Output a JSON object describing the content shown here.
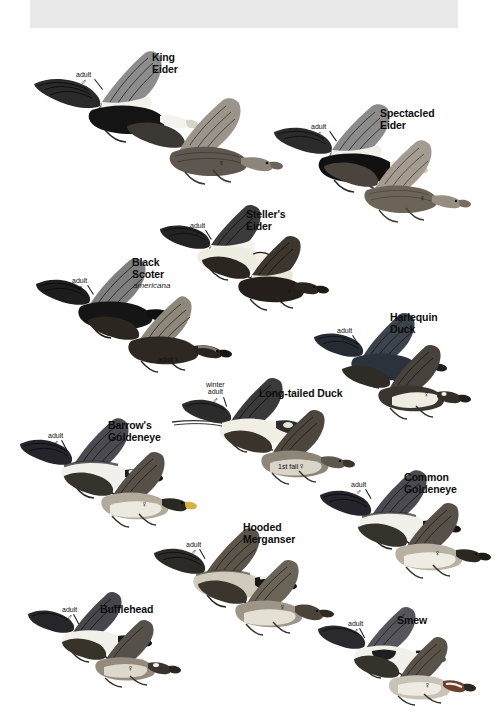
{
  "page": {
    "kind": "field-guide-plate",
    "background_color": "#ffffff",
    "banner_color": "#e8e8e8",
    "width": 484,
    "height": 725
  },
  "species": [
    {
      "id": "king-eider",
      "name": "King\nEider",
      "subspecies": "",
      "name_pos": {
        "x": 152,
        "y": 52
      },
      "callouts": [
        {
          "text": "adult",
          "symbol": "♂",
          "x": 76,
          "y": 63
        },
        {
          "text": "",
          "symbol": "♀",
          "x": 218,
          "y": 159
        }
      ]
    },
    {
      "id": "spectacled-eider",
      "name": "Spectacled\nEider",
      "subspecies": "",
      "name_pos": {
        "x": 380,
        "y": 108
      },
      "callouts": [
        {
          "text": "adult",
          "symbol": "♂",
          "x": 311,
          "y": 115
        },
        {
          "text": "",
          "symbol": "♀",
          "x": 419,
          "y": 194
        }
      ]
    },
    {
      "id": "stellers-eider",
      "name": "Steller's\nEider",
      "subspecies": "",
      "name_pos": {
        "x": 246,
        "y": 209
      },
      "callouts": [
        {
          "text": "adult",
          "symbol": "♂",
          "x": 190,
          "y": 214
        },
        {
          "text": "",
          "symbol": "♀",
          "x": 286,
          "y": 287
        }
      ]
    },
    {
      "id": "black-scoter",
      "name": "Black\nScoter",
      "subspecies": "americana",
      "name_pos": {
        "x": 132,
        "y": 257
      },
      "sub_pos": {
        "x": 133,
        "y": 281
      },
      "callouts": [
        {
          "text": "adult",
          "symbol": "♂",
          "x": 72,
          "y": 269
        },
        {
          "text": "adult",
          "symbol": "♀",
          "x": 160,
          "y": 349,
          "inline": true
        }
      ]
    },
    {
      "id": "harlequin-duck",
      "name": "Harlequin\nDuck",
      "subspecies": "",
      "name_pos": {
        "x": 390,
        "y": 312
      },
      "callouts": [
        {
          "text": "adult",
          "symbol": "♂",
          "x": 337,
          "y": 319
        },
        {
          "text": "",
          "symbol": "♀",
          "x": 423,
          "y": 390
        }
      ]
    },
    {
      "id": "long-tailed-duck",
      "name": "Long-tailed Duck",
      "subspecies": "",
      "name_pos": {
        "x": 259,
        "y": 388
      },
      "callouts": [
        {
          "text": "winter\nadult",
          "symbol": "♂",
          "x": 209,
          "y": 373
        },
        {
          "text": "1st fall",
          "symbol": "♀",
          "x": 280,
          "y": 456,
          "inline": true
        }
      ]
    },
    {
      "id": "barrows-goldeneye",
      "name": "Barrow's\nGoldeneye",
      "subspecies": "",
      "name_pos": {
        "x": 108,
        "y": 420
      },
      "callouts": [
        {
          "text": "adult",
          "symbol": "♂",
          "x": 48,
          "y": 424
        },
        {
          "text": "",
          "symbol": "♀",
          "x": 141,
          "y": 500
        }
      ]
    },
    {
      "id": "common-goldeneye",
      "name": "Common\nGoldeneye",
      "subspecies": "",
      "name_pos": {
        "x": 404,
        "y": 472
      },
      "callouts": [
        {
          "text": "adult",
          "symbol": "♂",
          "x": 351,
          "y": 473
        },
        {
          "text": "",
          "symbol": "♀",
          "x": 434,
          "y": 549
        }
      ]
    },
    {
      "id": "hooded-merganser",
      "name": "Hooded\nMerganser",
      "subspecies": "",
      "name_pos": {
        "x": 243,
        "y": 522
      },
      "callouts": [
        {
          "text": "adult",
          "symbol": "♂",
          "x": 186,
          "y": 533
        },
        {
          "text": "",
          "symbol": "♀",
          "x": 279,
          "y": 603
        }
      ]
    },
    {
      "id": "bufflehead",
      "name": "Bufflehead",
      "subspecies": "",
      "name_pos": {
        "x": 100,
        "y": 604
      },
      "callouts": [
        {
          "text": "adult",
          "symbol": "♂",
          "x": 62,
          "y": 598
        },
        {
          "text": "",
          "symbol": "♀",
          "x": 127,
          "y": 664
        }
      ]
    },
    {
      "id": "smew",
      "name": "Smew",
      "subspecies": "",
      "name_pos": {
        "x": 397,
        "y": 615
      },
      "callouts": [
        {
          "text": "adult",
          "symbol": "♂",
          "x": 348,
          "y": 612
        },
        {
          "text": "",
          "symbol": "♀",
          "x": 424,
          "y": 681
        }
      ]
    }
  ]
}
